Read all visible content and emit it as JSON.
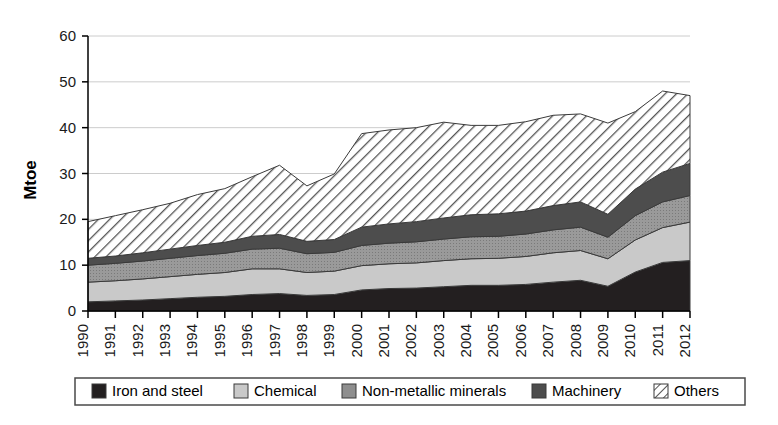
{
  "chart_data": {
    "type": "area",
    "stacked": true,
    "title": "",
    "xlabel": "",
    "ylabel": "Mtoe",
    "ylim": [
      0,
      60
    ],
    "yticks": [
      0,
      10,
      20,
      30,
      40,
      50,
      60
    ],
    "grid": true,
    "legend_position": "bottom",
    "categories": [
      "1990",
      "1991",
      "1992",
      "1993",
      "1994",
      "1995",
      "1996",
      "1997",
      "1998",
      "1999",
      "2000",
      "2001",
      "2002",
      "2003",
      "2004",
      "2005",
      "2006",
      "2007",
      "2008",
      "2009",
      "2010",
      "2011",
      "2012"
    ],
    "series": [
      {
        "name": "Iron and steel",
        "color": "#231f20",
        "pattern": "solid-black",
        "values": [
          2.0,
          2.2,
          2.4,
          2.7,
          3.0,
          3.2,
          3.6,
          3.8,
          3.4,
          3.6,
          4.6,
          4.9,
          5.0,
          5.3,
          5.6,
          5.6,
          5.8,
          6.3,
          6.7,
          5.4,
          8.5,
          10.6,
          11.0
        ]
      },
      {
        "name": "Chemical",
        "color": "#c9c9c9",
        "pattern": "light-gray",
        "values": [
          4.3,
          4.4,
          4.6,
          4.8,
          5.0,
          5.2,
          5.6,
          5.4,
          5.0,
          5.1,
          5.3,
          5.4,
          5.5,
          5.7,
          5.8,
          5.9,
          6.1,
          6.4,
          6.5,
          6.0,
          7.0,
          7.6,
          8.4
        ]
      },
      {
        "name": "Non-metallic minerals",
        "color": "#8e8e8e",
        "pattern": "mid-gray",
        "values": [
          3.7,
          3.8,
          3.9,
          4.0,
          4.1,
          4.2,
          4.3,
          4.5,
          4.1,
          4.1,
          4.4,
          4.5,
          4.6,
          4.7,
          4.8,
          4.8,
          4.9,
          5.0,
          5.1,
          4.7,
          5.3,
          5.6,
          5.8
        ]
      },
      {
        "name": "Machinery",
        "color": "#4d4d4d",
        "pattern": "dark-gray",
        "values": [
          1.5,
          1.6,
          1.8,
          2.0,
          2.2,
          2.4,
          2.8,
          3.0,
          2.7,
          2.8,
          4.0,
          4.2,
          4.4,
          4.6,
          4.8,
          4.9,
          5.0,
          5.3,
          5.5,
          5.0,
          5.8,
          6.5,
          7.0
        ]
      },
      {
        "name": "Others",
        "color": "#ffffff",
        "pattern": "diagonal-hatch",
        "values": [
          8.0,
          8.8,
          9.4,
          10.0,
          11.1,
          11.7,
          13.0,
          15.1,
          12.1,
          14.3,
          20.4,
          20.5,
          20.5,
          20.9,
          19.5,
          19.3,
          19.5,
          19.7,
          19.2,
          19.9,
          16.9,
          17.7,
          14.8
        ]
      }
    ],
    "totals": [
      19.5,
      20.8,
      22.1,
      23.5,
      25.4,
      26.7,
      29.3,
      31.8,
      27.3,
      29.9,
      38.7,
      39.5,
      40.0,
      41.2,
      40.5,
      40.5,
      41.3,
      42.7,
      43.0,
      41.0,
      43.5,
      48.0,
      47.0
    ]
  },
  "axis": {
    "y_title": "Mtoe",
    "y_ticks": [
      "0",
      "10",
      "20",
      "30",
      "40",
      "50",
      "60"
    ],
    "x_ticks": [
      "1990",
      "1991",
      "1992",
      "1993",
      "1994",
      "1995",
      "1996",
      "1997",
      "1998",
      "1999",
      "2000",
      "2001",
      "2002",
      "2003",
      "2004",
      "2005",
      "2006",
      "2007",
      "2008",
      "2009",
      "2010",
      "2011",
      "2012"
    ]
  },
  "legend": {
    "items": [
      {
        "label": "Iron and steel",
        "swatch": "solid-black"
      },
      {
        "label": "Chemical",
        "swatch": "light-gray"
      },
      {
        "label": "Non-metallic minerals",
        "swatch": "mid-gray"
      },
      {
        "label": "Machinery",
        "swatch": "dark-gray"
      },
      {
        "label": "Others",
        "swatch": "diagonal-hatch"
      }
    ]
  },
  "colors": {
    "iron_and_steel": "#231f20",
    "chemical": "#c9c9c9",
    "non_metallic_minerals": "#8e8e8e",
    "machinery": "#4d4d4d",
    "others": "#ffffff",
    "axis": "#000000",
    "grid": "#cccccc"
  }
}
